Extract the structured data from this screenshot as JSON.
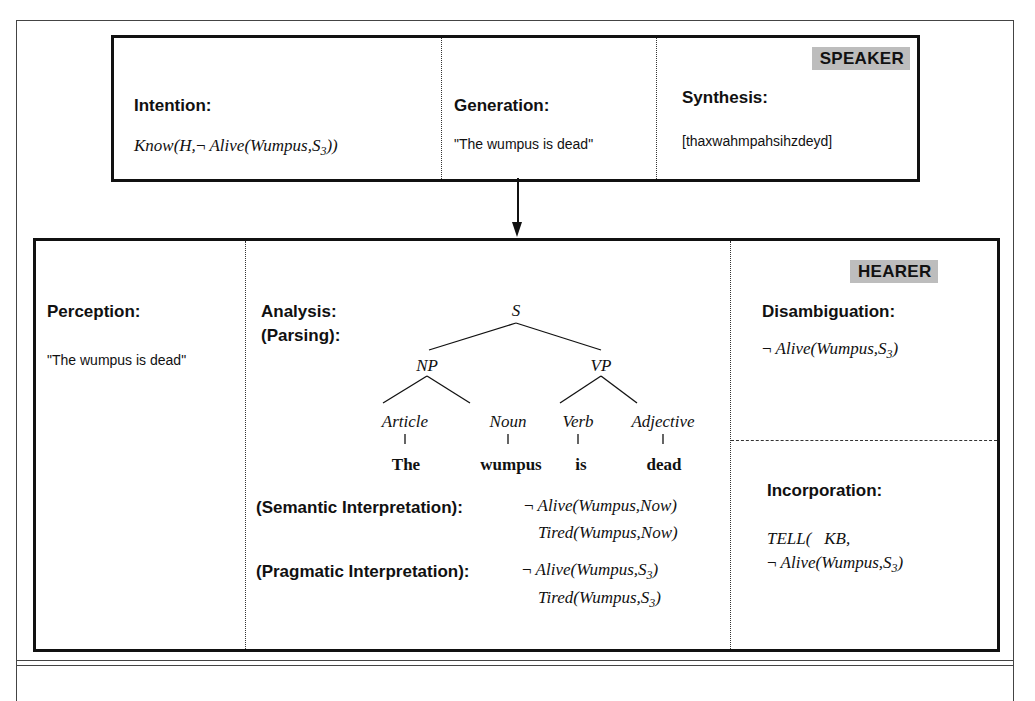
{
  "speaker": {
    "badge": "SPEAKER",
    "intention": {
      "heading": "Intention:",
      "expr_prefix": "Know(H,",
      "neg": "¬",
      "expr_main": "Alive(Wumpus,S",
      "sub": "3",
      "expr_suffix": "))"
    },
    "generation": {
      "heading": "Generation:",
      "text": "\"The wumpus is dead\""
    },
    "synthesis": {
      "heading": "Synthesis:",
      "text": "[thaxwahmpahsihzdeyd]"
    }
  },
  "hearer": {
    "badge": "HEARER",
    "perception": {
      "heading": "Perception:",
      "text": "\"The wumpus is dead\""
    },
    "analysis": {
      "heading_line1": "Analysis:",
      "heading_line2": "(Parsing):",
      "tree": {
        "root": "S",
        "np": "NP",
        "vp": "VP",
        "article": "Article",
        "noun": "Noun",
        "verb": "Verb",
        "adjective": "Adjective",
        "words": [
          "The",
          "wumpus",
          "is",
          "dead"
        ]
      },
      "semantic": {
        "heading": "(Semantic Interpretation):",
        "neg": "¬",
        "line1": "Alive(Wumpus,Now)",
        "line2": "Tired(Wumpus,Now)"
      },
      "pragmatic": {
        "heading": "(Pragmatic Interpretation):",
        "neg": "¬",
        "line1_main": "Alive(Wumpus,S",
        "line1_sub": "3",
        "line1_suffix": ")",
        "line2_main": "Tired(Wumpus,S",
        "line2_sub": "3",
        "line2_suffix": ")"
      }
    },
    "disambiguation": {
      "heading": "Disambiguation:",
      "neg": "¬",
      "expr_main": "Alive(Wumpus,S",
      "sub": "3",
      "expr_suffix": ")"
    },
    "incorporation": {
      "heading": "Incorporation:",
      "line1": "TELL(   KB,",
      "neg": "¬",
      "line2_main": "Alive(Wumpus,S",
      "sub": "3",
      "line2_suffix": ")"
    }
  },
  "colors": {
    "badge_bg": "#bdbdbd",
    "border": "#111111"
  }
}
